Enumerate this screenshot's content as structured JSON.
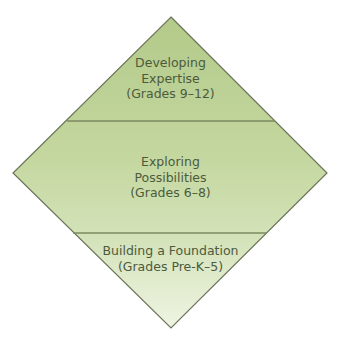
{
  "diagram": {
    "type": "diamond-pyramid",
    "colors": {
      "fill_top": "#b6cc8e",
      "fill_mid": "#c7d9a3",
      "fill_bottom": "#e8f0d8",
      "outline": "#6b7358",
      "divider": "#7c8a60",
      "text": "#4c5a3c"
    },
    "tiers": [
      {
        "position": "top",
        "lines": [
          "Developing",
          "Expertise",
          "(Grades 9–12)"
        ]
      },
      {
        "position": "middle",
        "lines": [
          "Exploring",
          "Possibilities",
          "(Grades 6–8)"
        ]
      },
      {
        "position": "bottom",
        "lines": [
          "Building a Foundation",
          "(Grades Pre-K–5)"
        ]
      }
    ]
  }
}
